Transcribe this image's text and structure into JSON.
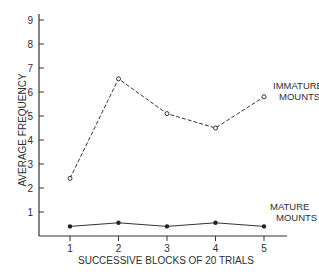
{
  "chart_data": {
    "type": "line",
    "title": "",
    "xlabel": "SUCCESSIVE BLOCKS OF 20 TRIALS",
    "ylabel": "AVERAGE FREQUENCY",
    "categories": [
      "1",
      "2",
      "3",
      "4",
      "5"
    ],
    "x": [
      1,
      2,
      3,
      4,
      5
    ],
    "yticks": [
      "1",
      "2",
      "3",
      "4",
      "5",
      "6",
      "7",
      "8",
      "9"
    ],
    "ylim": [
      0,
      9
    ],
    "grid": false,
    "legend_position": "inline-right",
    "series": [
      {
        "name": "IMMATURE MOUNTS",
        "label_lines": [
          "IMMATURE",
          "MOUNTS"
        ],
        "style": "dashed",
        "marker": "open-circle",
        "values": [
          2.4,
          6.55,
          5.1,
          4.5,
          5.8
        ]
      },
      {
        "name": "MATURE MOUNTS",
        "label_lines": [
          "MATURE",
          "MOUNTS"
        ],
        "style": "solid",
        "marker": "filled-circle",
        "values": [
          0.4,
          0.55,
          0.4,
          0.55,
          0.4
        ]
      }
    ]
  }
}
